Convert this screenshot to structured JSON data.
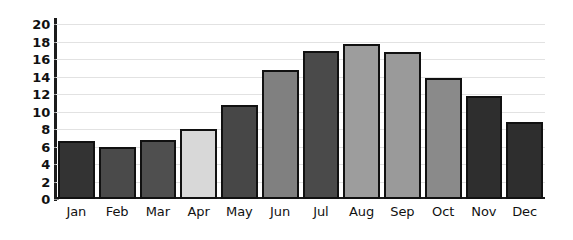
{
  "chart_data": {
    "type": "bar",
    "title": "",
    "subtitle": "",
    "xlabel": "",
    "ylabel": "",
    "categories": [
      "Jan",
      "Feb",
      "Mar",
      "Apr",
      "May",
      "Jun",
      "Jul",
      "Aug",
      "Sep",
      "Oct",
      "Nov",
      "Dec"
    ],
    "values": [
      6.6,
      5.9,
      6.7,
      8.0,
      10.8,
      14.7,
      16.9,
      17.7,
      16.8,
      13.8,
      11.8,
      8.8
    ],
    "bar_colors": [
      "#333333",
      "#4a4a4a",
      "#4f4f4f",
      "#d8d8d8",
      "#474747",
      "#808080",
      "#4a4a4a",
      "#9d9d9d",
      "#9a9a9a",
      "#8a8a8a",
      "#2e2e2e",
      "#2e2e2e"
    ],
    "ylim": [
      0,
      20
    ],
    "ytick_step": 2,
    "yticks": [
      0,
      2,
      4,
      6,
      8,
      10,
      12,
      14,
      16,
      18,
      20
    ],
    "ytick_labels": [
      "0",
      "2",
      "4",
      "6",
      "8",
      "10",
      "12",
      "14",
      "16",
      "18",
      "20"
    ],
    "grid": true,
    "grid_axis": "y",
    "grid_color": "#e2e2e2",
    "legend": false,
    "legend_position": "none",
    "axis_color": "#1b1b1b",
    "bar_outline_color": "#111111",
    "background_color": "#ffffff"
  }
}
